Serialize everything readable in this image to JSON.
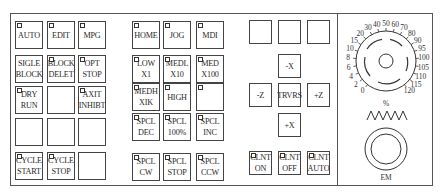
{
  "panel": {
    "mode_keys": [
      {
        "id": "auto",
        "lines": [
          "AUTO"
        ],
        "led": true
      },
      {
        "id": "edit",
        "lines": [
          "EDIT"
        ],
        "led": true
      },
      {
        "id": "mpg",
        "lines": [
          "MPG"
        ],
        "led": true
      },
      {
        "id": "single-block",
        "lines": [
          "SIGLE",
          "BLOCK"
        ],
        "led": false
      },
      {
        "id": "block-delete",
        "lines": [
          "BLOCK",
          "DELET"
        ],
        "led": true
      },
      {
        "id": "opt-stop",
        "lines": [
          "OPT",
          "STOP"
        ],
        "led": true
      },
      {
        "id": "dry-run",
        "lines": [
          "DRY",
          "RUN"
        ],
        "led": true
      },
      {
        "id": "blank-1",
        "lines": [],
        "led": false
      },
      {
        "id": "axis-inhibit",
        "lines": [
          "AXIT",
          "INHIBT"
        ],
        "led": true
      },
      {
        "id": "blank-2",
        "lines": [],
        "led": false
      },
      {
        "id": "blank-3",
        "lines": [],
        "led": false
      },
      {
        "id": "blank-4",
        "lines": [],
        "led": false
      },
      {
        "id": "cycle-start",
        "lines": [
          "CYCLE",
          "START"
        ],
        "led": true
      },
      {
        "id": "cycle-stop",
        "lines": [
          "CYCLE",
          "STOP"
        ],
        "led": true
      },
      {
        "id": "blank-5",
        "lines": [],
        "led": false
      }
    ],
    "jog_keys": [
      {
        "id": "home",
        "lines": [
          "HOME"
        ],
        "led": true
      },
      {
        "id": "jog",
        "lines": [
          "JOG"
        ],
        "led": true
      },
      {
        "id": "mdi",
        "lines": [
          "MDI"
        ],
        "led": true
      },
      {
        "id": "low-x1",
        "lines": [
          "LOW",
          "X1"
        ],
        "led": true
      },
      {
        "id": "medl-x10",
        "lines": [
          "MEDL",
          "X10"
        ],
        "led": true
      },
      {
        "id": "med-x100",
        "lines": [
          "MED",
          "X100"
        ],
        "led": true
      },
      {
        "id": "medh-x1k",
        "lines": [
          "MEDH",
          "XIK"
        ],
        "led": true
      },
      {
        "id": "high",
        "lines": [
          "HIGH"
        ],
        "led": true
      },
      {
        "id": "blank-6",
        "lines": [],
        "led": true
      },
      {
        "id": "spindle-dec",
        "lines": [
          "SPCL",
          "DEC"
        ],
        "led": true
      },
      {
        "id": "spindle-100",
        "lines": [
          "SPCL",
          "100%"
        ],
        "led": true
      },
      {
        "id": "spindle-inc",
        "lines": [
          "SPCL",
          "INC"
        ],
        "led": true
      },
      {
        "id": "spindle-cw",
        "lines": [
          "SPCL",
          "CW"
        ],
        "led": true
      },
      {
        "id": "spindle-stop",
        "lines": [
          "SPCL",
          "STOP"
        ],
        "led": true
      },
      {
        "id": "spindle-ccw",
        "lines": [
          "SPCL",
          "CCW"
        ],
        "led": true
      }
    ],
    "axis_keys": {
      "top_blank": [
        {
          "id": "blank-7"
        },
        {
          "id": "blank-8"
        },
        {
          "id": "blank-9"
        }
      ],
      "minus_x": "-X",
      "minus_z": "-Z",
      "traverse": "TRVRS",
      "plus_z": "+Z",
      "plus_x": "+X"
    },
    "coolant_keys": [
      {
        "id": "coolant-on",
        "lines": [
          "CLNT",
          "ON"
        ],
        "led": true
      },
      {
        "id": "coolant-off",
        "lines": [
          "CLNT",
          "OFF"
        ],
        "led": true
      },
      {
        "id": "coolant-auto",
        "lines": [
          "CLNT",
          "AUTO"
        ],
        "led": true
      }
    ],
    "feed_override_dial": {
      "scale": [
        "0",
        "2",
        "4",
        "6",
        "8",
        "10",
        "15",
        "20",
        "30",
        "40",
        "50",
        "60",
        "70",
        "80",
        "90",
        "95",
        "100",
        "105",
        "110",
        "115",
        "120"
      ],
      "unit": "%"
    },
    "emergency_stop": {
      "label": "EM"
    }
  }
}
